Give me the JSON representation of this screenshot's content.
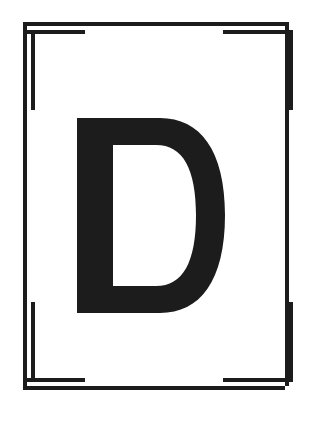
{
  "card": {
    "name": "letter-specimen-card",
    "background_color": "#ffffff",
    "ink_color": "#1c1c1c",
    "width": 311,
    "height": 421
  },
  "glyph": {
    "character": "D",
    "label": "capital-letter-d",
    "color": "#1c1c1c",
    "style": "bold sans-serif slab",
    "bounds": {
      "x": 77,
      "y": 118,
      "width": 148,
      "height": 195
    }
  },
  "frame": {
    "label": "nested-corner-registration-marks",
    "stroke_color": "#1c1c1c",
    "stroke_width": 4,
    "outer_rect": {
      "x": 23,
      "y": 22,
      "width": 266,
      "height": 368
    },
    "inner_offset": 8,
    "arm_length": 62,
    "corners": [
      {
        "id": "top-left",
        "label": "corner-mark-top-left"
      },
      {
        "id": "top-right",
        "label": "corner-mark-top-right"
      },
      {
        "id": "bottom-left",
        "label": "corner-mark-bottom-left"
      },
      {
        "id": "bottom-right",
        "label": "corner-mark-bottom-right"
      }
    ]
  },
  "accessibility": {
    "description": "Black capital letter D on a white card framed by four nested L-shaped corner crop marks"
  }
}
